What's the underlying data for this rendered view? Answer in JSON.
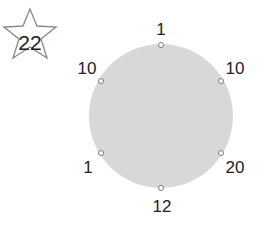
{
  "badge": {
    "icon": "star-icon",
    "value": "22"
  },
  "puzzle": {
    "shape": "circle",
    "fill_color": "#d8d8d8",
    "nodes": [
      {
        "position": "top",
        "value": "1"
      },
      {
        "position": "upper-right",
        "value": "10"
      },
      {
        "position": "lower-right",
        "value": "20"
      },
      {
        "position": "bottom",
        "value": "12"
      },
      {
        "position": "lower-left",
        "value": "1"
      },
      {
        "position": "upper-left",
        "value": "10"
      }
    ]
  }
}
